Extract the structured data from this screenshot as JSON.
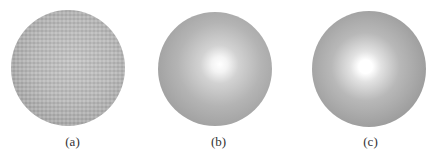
{
  "panels": [
    {
      "id": "a",
      "label": "(a)",
      "description": "textured sphere, uniform shading"
    },
    {
      "id": "b",
      "label": "(b)",
      "description": "smooth sphere with soft specular highlight"
    },
    {
      "id": "c",
      "label": "(c)",
      "description": "smooth sphere with bright specular highlight"
    }
  ]
}
